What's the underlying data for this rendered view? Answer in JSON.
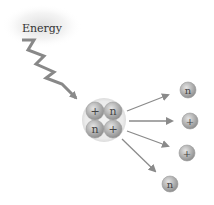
{
  "diagram": {
    "energy_label": "Energy",
    "nucleus": {
      "particles": [
        {
          "symbol": "+",
          "type": "proton"
        },
        {
          "symbol": "n",
          "type": "neutron"
        },
        {
          "symbol": "n",
          "type": "neutron"
        },
        {
          "symbol": "+",
          "type": "proton"
        }
      ]
    },
    "ejected_particles": [
      {
        "symbol": "n",
        "type": "neutron"
      },
      {
        "symbol": "+",
        "type": "proton"
      },
      {
        "symbol": "+",
        "type": "proton"
      },
      {
        "symbol": "n",
        "type": "neutron"
      }
    ],
    "colors": {
      "particle": "#b8b8b8",
      "arrow": "#8a8a8a",
      "glow": "#e6e6e6",
      "nucleus_halo": "#ececec"
    }
  }
}
